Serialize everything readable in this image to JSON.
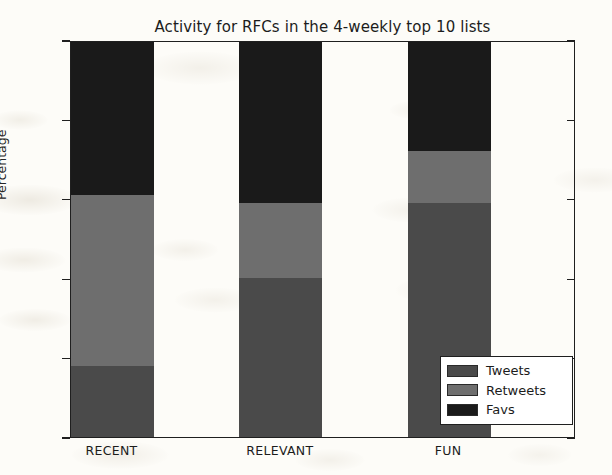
{
  "chart_data": {
    "type": "bar",
    "subtype": "stacked-bar",
    "title": "Activity for RFCs in the 4-weekly top 10 lists",
    "xlabel": "",
    "ylabel": "Percentage",
    "categories": [
      "RECENT",
      "RELEVANT",
      "FUN"
    ],
    "series": [
      {
        "name": "Tweets",
        "color": "#4a4a4a",
        "values": [
          18,
          40,
          59
        ]
      },
      {
        "name": "Retweets",
        "color": "#6e6e6e",
        "values": [
          43,
          19,
          13
        ]
      },
      {
        "name": "Favs",
        "color": "#1a1a1a",
        "values": [
          39,
          41,
          28
        ]
      }
    ],
    "cumulative_boundaries": {
      "RECENT": [
        18,
        61,
        100
      ],
      "RELEVANT": [
        40,
        59,
        100
      ],
      "FUN": [
        59,
        72,
        100
      ]
    },
    "ylim": [
      0,
      100
    ],
    "yticks": [
      0,
      20,
      40,
      60,
      80,
      100
    ],
    "ytick_labels": [
      "0",
      "20",
      "40",
      "60",
      "80",
      "100"
    ],
    "grid": false,
    "legend_position": "lower right",
    "legend_entries": [
      "Tweets",
      "Retweets",
      "Favs"
    ]
  },
  "axes": {
    "y_label": "Percentage",
    "y_ticks": [
      {
        "value": 100,
        "label": "100"
      },
      {
        "value": 80,
        "label": "80"
      },
      {
        "value": 60,
        "label": "60"
      },
      {
        "value": 40,
        "label": "40"
      },
      {
        "value": 20,
        "label": "20"
      },
      {
        "value": 0,
        "label": "0"
      }
    ],
    "x_ticks": [
      {
        "label": "RECENT"
      },
      {
        "label": "RELEVANT"
      },
      {
        "label": "FUN"
      }
    ]
  },
  "legend": {
    "items": [
      {
        "label": "Tweets",
        "color": "#4a4a4a"
      },
      {
        "label": "Retweets",
        "color": "#6e6e6e"
      },
      {
        "label": "Favs",
        "color": "#1a1a1a"
      }
    ]
  }
}
